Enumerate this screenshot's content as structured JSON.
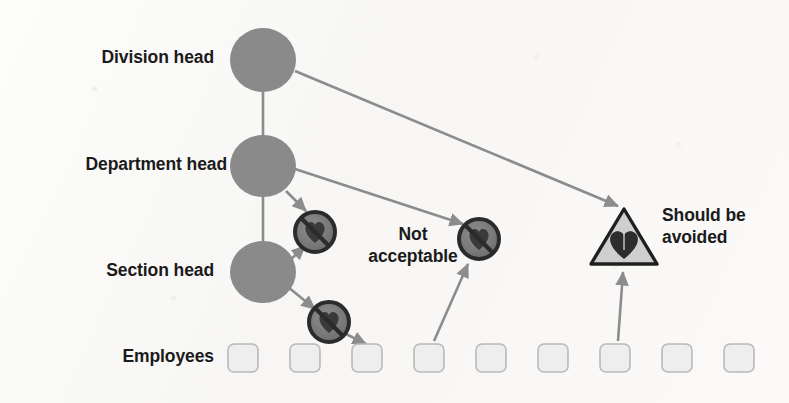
{
  "diagram": {
    "type": "org-hierarchy",
    "background_color": "#fbfaf9",
    "node_color": "#8a8a8a",
    "box_fill_color": "#eeeeee",
    "box_stroke_color": "#b9b9b9",
    "connector_color": "#8c8c8c",
    "prohibited_icon_color": "#6f6f6f",
    "prohibited_ring_color": "#2b2b2b",
    "warning_triangle_fill": "#cfcfcf",
    "warning_triangle_stroke": "#1f1f1f"
  },
  "row_labels": [
    {
      "id": "division-head",
      "label": "Division head"
    },
    {
      "id": "department-head",
      "label": "Department head"
    },
    {
      "id": "section-head",
      "label": "Section head"
    },
    {
      "id": "employees",
      "label": "Employees"
    }
  ],
  "nodes": [
    {
      "id": "division-head-node",
      "label": "Division head",
      "shape": "ellipse",
      "cx": 263,
      "cy": 60,
      "rx": 33,
      "ry": 32
    },
    {
      "id": "department-head-node",
      "label": "Department head",
      "shape": "ellipse",
      "cx": 263,
      "cy": 166,
      "rx": 33,
      "ry": 31
    },
    {
      "id": "section-head-node",
      "label": "Section head",
      "shape": "ellipse",
      "cx": 263,
      "cy": 272,
      "rx": 33,
      "ry": 31
    }
  ],
  "employee_boxes": [
    {
      "id": "employee-1",
      "x": 228,
      "y": 344,
      "w": 30,
      "h": 28
    },
    {
      "id": "employee-2",
      "x": 290,
      "y": 344,
      "w": 30,
      "h": 28
    },
    {
      "id": "employee-3",
      "x": 352,
      "y": 344,
      "w": 30,
      "h": 28
    },
    {
      "id": "employee-4",
      "x": 414,
      "y": 344,
      "w": 30,
      "h": 28
    },
    {
      "id": "employee-5",
      "x": 476,
      "y": 344,
      "w": 30,
      "h": 28
    },
    {
      "id": "employee-6",
      "x": 538,
      "y": 344,
      "w": 30,
      "h": 28
    },
    {
      "id": "employee-7",
      "x": 600,
      "y": 344,
      "w": 30,
      "h": 28
    },
    {
      "id": "employee-8",
      "x": 662,
      "y": 344,
      "w": 30,
      "h": 28
    },
    {
      "id": "employee-9",
      "x": 724,
      "y": 344,
      "w": 30,
      "h": 28
    }
  ],
  "hierarchy_links": [
    {
      "id": "link-division-department",
      "from": "division-head-node",
      "to": "department-head-node",
      "style": "plain"
    },
    {
      "id": "link-department-section",
      "from": "department-head-node",
      "to": "section-head-node",
      "style": "plain"
    }
  ],
  "violation_arrows": [
    {
      "id": "arrow-division-to-triangle",
      "from": "division-head-node",
      "to": "warning-triangle",
      "label": "Should be avoided"
    },
    {
      "id": "arrow-department-to-skip",
      "from": "department-head-node",
      "to": "prohibited-icon-mid",
      "label": "Not acceptable"
    },
    {
      "id": "arrow-department-to-section-skip",
      "from": "department-head-node",
      "to": "prohibited-icon-upper",
      "label": "Not acceptable"
    },
    {
      "id": "arrow-section-to-upper-skip",
      "from": "section-head-node",
      "to": "prohibited-icon-upper",
      "label": "Not acceptable"
    },
    {
      "id": "arrow-section-to-employee-skip",
      "from": "section-head-node",
      "to": "prohibited-icon-lower",
      "label": "Not acceptable"
    },
    {
      "id": "arrow-lower-skip-to-employee",
      "from": "prohibited-icon-lower",
      "to": "employee-3",
      "label": "Not acceptable"
    },
    {
      "id": "arrow-employee4-to-mid-skip",
      "from": "employee-4",
      "to": "prohibited-icon-mid",
      "label": "Not acceptable"
    },
    {
      "id": "arrow-employee7-to-triangle",
      "from": "employee-7",
      "to": "warning-triangle",
      "label": "Should be avoided"
    }
  ],
  "prohibited_icons": [
    {
      "id": "prohibited-icon-upper",
      "cx": 315,
      "cy": 232,
      "r": 21,
      "meaning": "not acceptable"
    },
    {
      "id": "prohibited-icon-mid",
      "cx": 479,
      "cy": 239,
      "r": 21,
      "meaning": "not acceptable"
    },
    {
      "id": "prohibited-icon-lower",
      "cx": 329,
      "cy": 322,
      "r": 21,
      "meaning": "not acceptable"
    }
  ],
  "warning_triangle": {
    "id": "warning-triangle",
    "cx": 624,
    "cy": 238,
    "half_width": 31,
    "height": 52,
    "meaning": "should be avoided"
  },
  "callouts": [
    {
      "id": "callout-not-acceptable",
      "lines": [
        "Not",
        "acceptable"
      ],
      "text": "Not acceptable"
    },
    {
      "id": "callout-should-be-avoided",
      "lines": [
        "Should be",
        "avoided"
      ],
      "text": "Should be avoided"
    }
  ]
}
